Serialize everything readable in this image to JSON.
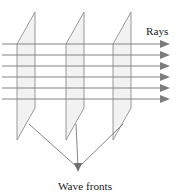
{
  "figure": {
    "background_color": "#ffffff",
    "labels": {
      "rays": "Rays",
      "wave_fronts": "Wave fronts"
    },
    "colors": {
      "plane_fill": "#f2f2f2",
      "plane_stroke": "#8d8d8d",
      "ray_stroke": "#848484",
      "ray_head_fill": "#7d7d7d",
      "leader_stroke": "#6f6f6f",
      "text": "#1b1b1b"
    },
    "counts": {
      "wave_front_planes": 3,
      "rays": 6,
      "leader_lines": 3
    },
    "geometry": {
      "width": 181,
      "height": 196,
      "plane_shape": "parallelogram",
      "plane_top_offset_x": 18,
      "plane_width": 17,
      "plane_height": 96,
      "plane_origins_x": [
        17,
        66,
        113
      ],
      "plane_top_y": 12,
      "plane_bottom_y": 140,
      "ray_start_x": 2,
      "ray_end_x": 159,
      "ray_y_values": [
        44,
        55,
        66,
        77,
        88,
        99
      ],
      "arrow_tip_x": 170,
      "arrow_length": 9,
      "arrow_half_height": 4,
      "leader_start_points": [
        [
          29,
          124
        ],
        [
          76,
          124
        ],
        [
          123,
          124
        ]
      ],
      "leader_converge_point": [
        78,
        170
      ],
      "rays_label_pos": [
        146,
        35
      ],
      "wave_fronts_label_pos": [
        85,
        190
      ]
    }
  }
}
